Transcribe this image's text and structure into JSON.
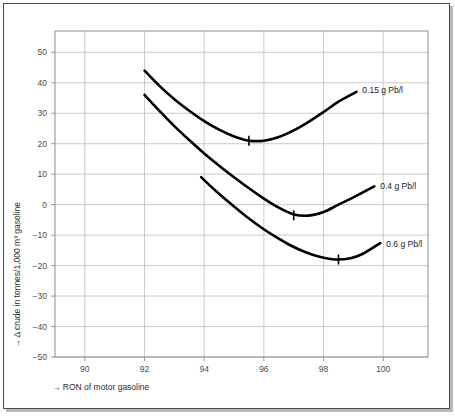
{
  "figure": {
    "background": "#ffffff",
    "frame_color": "#4a4a4a"
  },
  "chart_data": {
    "type": "line",
    "title": "",
    "subtitle": "",
    "xlabel": "→ RON of motor gasoline",
    "ylabel": "→ Δ crude in tonnes/1,000 m³ gasoline",
    "xlim": [
      89,
      101.5
    ],
    "ylim": [
      -50,
      57
    ],
    "xticks": [
      90,
      92,
      94,
      96,
      98,
      100
    ],
    "xticklabels": [
      "90",
      "92",
      "94",
      "96",
      "98",
      "100"
    ],
    "yticks": [
      -50,
      -40,
      -30,
      -20,
      -10,
      0,
      10,
      20,
      30,
      40,
      50
    ],
    "yticklabels": [
      "−50",
      "−40",
      "−30",
      "−20",
      "−10",
      "0",
      "10",
      "20",
      "30",
      "40",
      "50"
    ],
    "grid": true,
    "grid_x": [
      90,
      92,
      94,
      96,
      98,
      100
    ],
    "grid_y": [
      -50,
      -40,
      -30,
      -20,
      -10,
      0,
      10,
      20,
      30,
      40,
      50
    ],
    "legend_position": "inline-right",
    "line_color": "#000000",
    "series": [
      {
        "name": "0.15 g Pb/l",
        "label": "0.15 g Pb/l",
        "label_x": 99.3,
        "label_y": 37.5,
        "minimum": {
          "x": 95.5,
          "y": 21.0
        },
        "x": [
          92.0,
          92.5,
          93.0,
          93.5,
          94.0,
          94.5,
          95.0,
          95.5,
          96.0,
          96.5,
          97.0,
          97.5,
          98.0,
          98.5,
          99.1
        ],
        "y": [
          44.0,
          39.0,
          34.6,
          30.8,
          27.4,
          24.6,
          22.4,
          21.0,
          21.0,
          22.2,
          24.4,
          27.2,
          30.4,
          33.8,
          37.0
        ]
      },
      {
        "name": "0.4 g Pb/l",
        "label": "0.4 g Pb/l",
        "label_x": 99.9,
        "label_y": 6.0,
        "minimum": {
          "x": 97.0,
          "y": -3.5
        },
        "x": [
          92.0,
          92.5,
          93.0,
          93.5,
          94.0,
          94.5,
          95.0,
          95.5,
          96.0,
          96.5,
          97.0,
          97.5,
          98.0,
          98.5,
          99.0,
          99.7
        ],
        "y": [
          36.0,
          30.8,
          25.8,
          21.2,
          16.8,
          12.8,
          9.0,
          5.4,
          2.0,
          -1.0,
          -3.2,
          -3.6,
          -2.4,
          0.0,
          2.4,
          6.0
        ]
      },
      {
        "name": "0.6 g Pb/l",
        "label": "0.6 g Pb/l",
        "label_x": 100.1,
        "label_y": -13.0,
        "minimum": {
          "x": 98.5,
          "y": -18.0
        },
        "x": [
          93.9,
          94.4,
          94.9,
          95.4,
          95.9,
          96.4,
          96.9,
          97.4,
          97.9,
          98.4,
          98.9,
          99.3,
          99.9
        ],
        "y": [
          9.0,
          4.4,
          0.2,
          -3.8,
          -7.4,
          -10.6,
          -13.4,
          -15.6,
          -17.2,
          -18.0,
          -17.6,
          -16.2,
          -12.6
        ]
      }
    ]
  }
}
